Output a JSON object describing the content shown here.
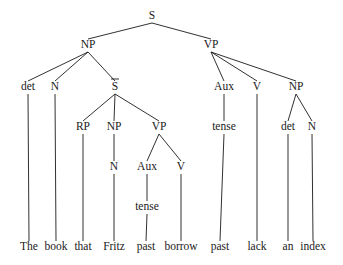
{
  "diagram": {
    "type": "syntax-tree",
    "nodes": [
      {
        "id": "S",
        "label": "S",
        "x": 152,
        "y": 19
      },
      {
        "id": "NP1",
        "label": "NP",
        "x": 88,
        "y": 48
      },
      {
        "id": "VP1",
        "label": "VP",
        "x": 211,
        "y": 48
      },
      {
        "id": "det1",
        "label": "det",
        "x": 28,
        "y": 90
      },
      {
        "id": "N1",
        "label": "N",
        "x": 55,
        "y": 90
      },
      {
        "id": "Sbar",
        "label": "S",
        "overbar": true,
        "x": 115,
        "y": 90
      },
      {
        "id": "Aux1",
        "label": "Aux",
        "x": 224,
        "y": 90
      },
      {
        "id": "V1",
        "label": "V",
        "x": 257,
        "y": 90
      },
      {
        "id": "NP2",
        "label": "NP",
        "x": 296,
        "y": 90
      },
      {
        "id": "RP",
        "label": "RP",
        "x": 83,
        "y": 130
      },
      {
        "id": "NP3",
        "label": "NP",
        "x": 114,
        "y": 130
      },
      {
        "id": "VP2",
        "label": "VP",
        "x": 159,
        "y": 130
      },
      {
        "id": "tense1",
        "label": "tense",
        "x": 224,
        "y": 130
      },
      {
        "id": "det2",
        "label": "det",
        "x": 288,
        "y": 130
      },
      {
        "id": "N2",
        "label": "N",
        "x": 312,
        "y": 130
      },
      {
        "id": "N3",
        "label": "N",
        "x": 114,
        "y": 170
      },
      {
        "id": "Aux2",
        "label": "Aux",
        "x": 147,
        "y": 170
      },
      {
        "id": "V2",
        "label": "V",
        "x": 181,
        "y": 170
      },
      {
        "id": "tense2",
        "label": "tense",
        "x": 147,
        "y": 210
      },
      {
        "id": "w_the",
        "label": "The",
        "x": 29,
        "y": 250
      },
      {
        "id": "w_book",
        "label": "book",
        "x": 56,
        "y": 250
      },
      {
        "id": "w_that",
        "label": "that",
        "x": 83,
        "y": 250
      },
      {
        "id": "w_fritz",
        "label": "Fritz",
        "x": 114,
        "y": 250
      },
      {
        "id": "w_past1",
        "label": "past",
        "x": 146,
        "y": 250
      },
      {
        "id": "w_borrow",
        "label": "borrow",
        "x": 181,
        "y": 250
      },
      {
        "id": "w_past2",
        "label": "past",
        "x": 220,
        "y": 250
      },
      {
        "id": "w_lack",
        "label": "lack",
        "x": 257,
        "y": 250
      },
      {
        "id": "w_an",
        "label": "an",
        "x": 288,
        "y": 250
      },
      {
        "id": "w_index",
        "label": "index",
        "x": 313,
        "y": 250
      }
    ],
    "edges": [
      [
        "S",
        "NP1"
      ],
      [
        "S",
        "VP1"
      ],
      [
        "NP1",
        "det1"
      ],
      [
        "NP1",
        "N1"
      ],
      [
        "NP1",
        "Sbar"
      ],
      [
        "VP1",
        "Aux1"
      ],
      [
        "VP1",
        "V1"
      ],
      [
        "VP1",
        "NP2"
      ],
      [
        "Sbar",
        "RP"
      ],
      [
        "Sbar",
        "NP3"
      ],
      [
        "Sbar",
        "VP2"
      ],
      [
        "Aux1",
        "tense1"
      ],
      [
        "NP2",
        "det2"
      ],
      [
        "NP2",
        "N2"
      ],
      [
        "NP3",
        "N3"
      ],
      [
        "VP2",
        "Aux2"
      ],
      [
        "VP2",
        "V2"
      ],
      [
        "Aux2",
        "tense2"
      ],
      [
        "det1",
        "w_the"
      ],
      [
        "N1",
        "w_book"
      ],
      [
        "RP",
        "w_that"
      ],
      [
        "N3",
        "w_fritz"
      ],
      [
        "tense2",
        "w_past1"
      ],
      [
        "V2",
        "w_borrow"
      ],
      [
        "tense1",
        "w_past2"
      ],
      [
        "V1",
        "w_lack"
      ],
      [
        "det2",
        "w_an"
      ],
      [
        "N2",
        "w_index"
      ]
    ]
  }
}
